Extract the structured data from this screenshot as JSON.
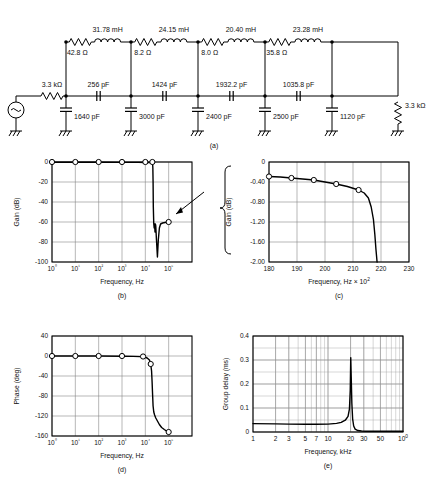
{
  "figure": {
    "panels": [
      {
        "id": "a",
        "caption": "(a)"
      },
      {
        "id": "b",
        "caption": "(b)"
      },
      {
        "id": "c",
        "caption": "(c)"
      },
      {
        "id": "d",
        "caption": "(d)"
      },
      {
        "id": "e",
        "caption": "(e)"
      }
    ]
  },
  "circuit": {
    "source_label": "~",
    "source_resistor": "3.3 kΩ",
    "load_resistor": "3.3 kΩ",
    "series_inductors": [
      "31.78 mH",
      "24.15 mH",
      "20.40 mH",
      "23.28 mH"
    ],
    "series_resistors": [
      "42.8 Ω",
      "8.2 Ω",
      "8.0 Ω",
      "35.8 Ω"
    ],
    "series_capacitors": [
      "256 pF",
      "1424 pF",
      "1932.2 pF",
      "1035.8 pF"
    ],
    "shunt_capacitors": [
      "1640 pF",
      "3000 pF",
      "2400 pF",
      "2500 pF",
      "1120 pF"
    ],
    "ground_symbol": "gnd"
  },
  "chart_data": [
    {
      "id": "b",
      "type": "line",
      "title": "",
      "xlabel": "Frequency, Hz",
      "ylabel": "Gain (dB)",
      "xscale": "log",
      "xlim": [
        1,
        1000000
      ],
      "ylim": [
        -100,
        0
      ],
      "xticks": [
        "10⁰",
        "10¹",
        "10²",
        "10³",
        "10⁴",
        "10⁵"
      ],
      "xtick_values": [
        1,
        10,
        100,
        1000,
        10000,
        100000
      ],
      "yticks": [
        "0",
        "-20",
        "-40",
        "-60",
        "-80",
        "-100"
      ],
      "ytick_values": [
        0,
        -20,
        -40,
        -60,
        -80,
        -100
      ],
      "grid": true,
      "markers_x": [
        1,
        10,
        100,
        1000,
        10000,
        20000,
        100000
      ],
      "markers_y": [
        0,
        0,
        0,
        0,
        0,
        0,
        -60
      ],
      "x": [
        1,
        10,
        100,
        1000,
        5000,
        10000,
        15000,
        19000,
        20500,
        21000,
        21500,
        22000,
        23000,
        24000,
        25000,
        26000,
        27000,
        28000,
        30000,
        33000,
        36000,
        40000,
        45000,
        55000,
        70000,
        85000,
        100000
      ],
      "y": [
        -0.3,
        -0.3,
        -0.3,
        -0.35,
        -0.4,
        -0.45,
        -0.5,
        -0.6,
        -1.5,
        -6,
        -20,
        -45,
        -62,
        -66,
        -62,
        -70,
        -62,
        -64,
        -78,
        -95,
        -78,
        -66,
        -62,
        -61,
        -60.5,
        -60.2,
        -60
      ]
    },
    {
      "id": "c",
      "type": "line",
      "title": "",
      "xlabel": "Frequency, Hz × 10²",
      "ylabel": "Gain (dB)",
      "xscale": "linear",
      "xlim": [
        180,
        230
      ],
      "ylim": [
        -2.0,
        0
      ],
      "xticks": [
        "180",
        "190",
        "200",
        "210",
        "220",
        "230"
      ],
      "xtick_values": [
        180,
        190,
        200,
        210,
        220,
        230
      ],
      "yticks": [
        "0",
        "-0.40",
        "-0.80",
        "-1.20",
        "-1.60",
        "-2.00"
      ],
      "ytick_values": [
        0,
        -0.4,
        -0.8,
        -1.2,
        -1.6,
        -2.0
      ],
      "grid": true,
      "markers_x": [
        180,
        188,
        196,
        204,
        212
      ],
      "markers_y": [
        -0.29,
        -0.32,
        -0.36,
        -0.44,
        -0.56
      ],
      "x": [
        180,
        184,
        188,
        192,
        196,
        200,
        204,
        208,
        212,
        214,
        215.5,
        216.5,
        217.3,
        217.8,
        218.2,
        218.6
      ],
      "y": [
        -0.29,
        -0.3,
        -0.32,
        -0.34,
        -0.36,
        -0.4,
        -0.44,
        -0.49,
        -0.56,
        -0.62,
        -0.72,
        -0.9,
        -1.15,
        -1.45,
        -1.75,
        -2.0
      ]
    },
    {
      "id": "d",
      "type": "line",
      "title": "",
      "xlabel": "Frequency, Hz",
      "ylabel": "Phase (deg)",
      "xscale": "log",
      "xlim": [
        1,
        1000000
      ],
      "ylim": [
        -160,
        40
      ],
      "xticks": [
        "10⁰",
        "10¹",
        "10²",
        "10³",
        "10⁴",
        "10⁵"
      ],
      "xtick_values": [
        1,
        10,
        100,
        1000,
        10000,
        100000
      ],
      "yticks": [
        "40",
        "0",
        "-40",
        "-80",
        "-120",
        "-160"
      ],
      "ytick_values": [
        40,
        0,
        -40,
        -80,
        -120,
        -160
      ],
      "grid": true,
      "markers_x": [
        1,
        10,
        100,
        1000,
        8000,
        17000,
        100000
      ],
      "markers_y": [
        0,
        0,
        0,
        0,
        -1,
        -16,
        -152
      ],
      "x": [
        1,
        10,
        100,
        1000,
        3000,
        6000,
        9000,
        12000,
        15000,
        17000,
        18500,
        19500,
        20500,
        21500,
        23000,
        25000,
        28000,
        33000,
        40000,
        50000,
        65000,
        80000,
        100000
      ],
      "y": [
        0,
        0,
        0,
        -0.4,
        -0.8,
        -1.2,
        -2,
        -4,
        -8,
        -16,
        -30,
        -52,
        -78,
        -100,
        -112,
        -118,
        -124,
        -130,
        -137,
        -143,
        -147,
        -150,
        -152
      ]
    },
    {
      "id": "e",
      "type": "line",
      "title": "",
      "xlabel": "Frequency, kHz",
      "ylabel": "Group delay (ms)",
      "xscale": "log",
      "xlim": [
        1,
        100
      ],
      "ylim": [
        0,
        0.4
      ],
      "xticks": [
        "1",
        "2",
        "3",
        "5",
        "7",
        "10",
        "20",
        "30",
        "50",
        "100"
      ],
      "xtick_values": [
        1,
        2,
        3,
        5,
        7,
        10,
        20,
        30,
        50,
        100
      ],
      "yticks": [
        "0.4",
        "0.3",
        "0.2",
        "0.1",
        "0"
      ],
      "ytick_values": [
        0.4,
        0.3,
        0.2,
        0.1,
        0
      ],
      "grid": true,
      "x": [
        1,
        2,
        3,
        5,
        7,
        10,
        13,
        15,
        17,
        18.5,
        19.3,
        19.8,
        20.1,
        20.4,
        20.8,
        21.3,
        22,
        23,
        25,
        28,
        32,
        40,
        50,
        65,
        80,
        100
      ],
      "y": [
        0.035,
        0.034,
        0.033,
        0.032,
        0.032,
        0.033,
        0.036,
        0.04,
        0.049,
        0.065,
        0.095,
        0.175,
        0.31,
        0.23,
        0.12,
        0.055,
        0.025,
        0.012,
        0.006,
        0.004,
        0.003,
        0.003,
        0.003,
        0.003,
        0.003,
        0.003
      ]
    }
  ]
}
